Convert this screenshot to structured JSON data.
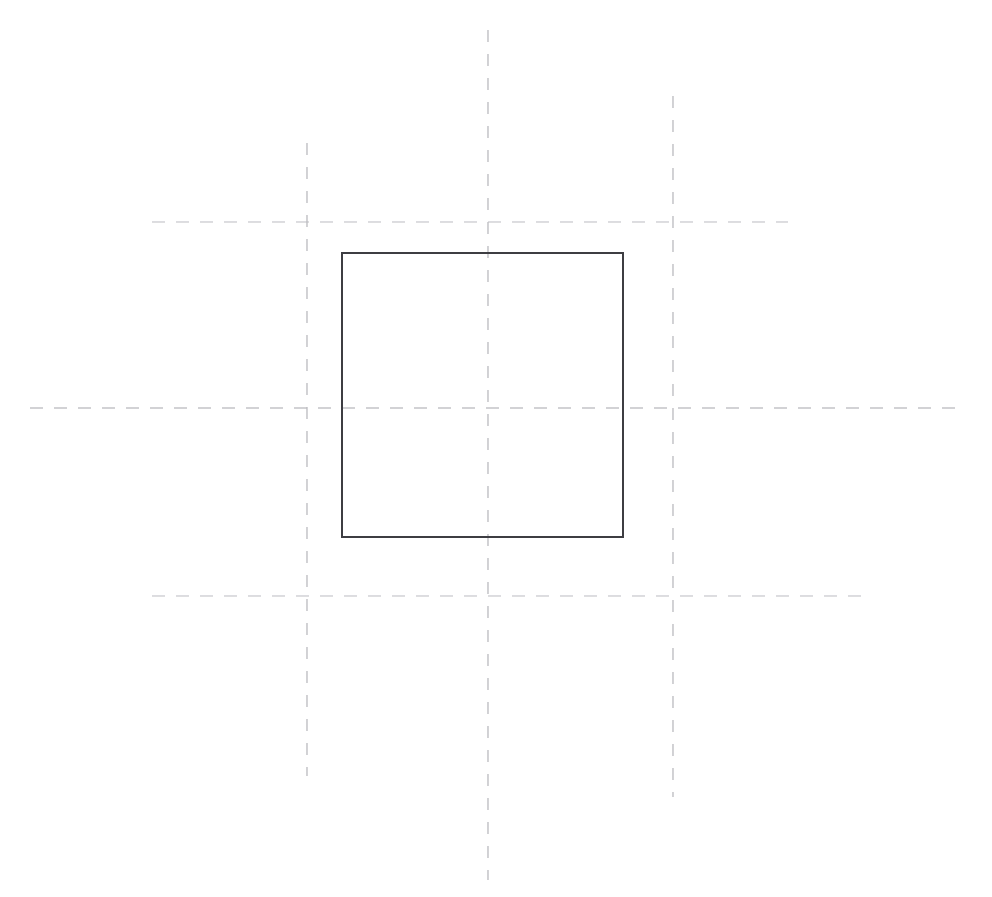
{
  "drawing": {
    "title": "Technical Line Drawing",
    "background_color": "#ffffff",
    "canvas": {
      "width": 992,
      "height": 897
    },
    "styles": {
      "construction_line_color": "#bcbcc0",
      "construction_line_faint_color": "#c6c6ca",
      "outline_color": "#3d3d42",
      "outline_width": 1.6,
      "dash_pattern_horizontal": "13 11",
      "dash_pattern_vertical": "12 12"
    },
    "shapes": [
      {
        "id": "main-square",
        "name": "square-outline",
        "type": "rect",
        "x": 342,
        "y": 253,
        "width": 281,
        "height": 284,
        "stroke": "#3d3d42",
        "stroke_width": 1.6,
        "fill": "none"
      }
    ],
    "construction_lines": [
      {
        "id": "vline-center",
        "name": "vertical-centerline-center",
        "orientation": "vertical",
        "x": 488,
        "y1": 30,
        "y2": 880,
        "style": "dashed",
        "color": "#bcbcc0"
      },
      {
        "id": "vline-left",
        "name": "vertical-centerline-left",
        "orientation": "vertical",
        "x": 307,
        "y1": 143,
        "y2": 776,
        "style": "dashed",
        "color": "#bcbcc0"
      },
      {
        "id": "vline-right",
        "name": "vertical-centerline-right",
        "orientation": "vertical",
        "x": 673,
        "y1": 96,
        "y2": 797,
        "style": "dashed",
        "color": "#bcbcc0"
      },
      {
        "id": "hline-center",
        "name": "horizontal-centerline-center",
        "orientation": "horizontal",
        "y": 408,
        "x1": 30,
        "x2": 962,
        "style": "dashed",
        "color": "#b9b9bd"
      },
      {
        "id": "hline-top",
        "name": "horizontal-centerline-top",
        "orientation": "horizontal",
        "y": 222,
        "x1": 152,
        "x2": 788,
        "style": "dashed",
        "color": "#c6c6ca"
      },
      {
        "id": "hline-bottom",
        "name": "horizontal-centerline-bottom",
        "orientation": "horizontal",
        "y": 596,
        "x1": 152,
        "x2": 868,
        "style": "dashed",
        "color": "#c6c6ca"
      }
    ]
  }
}
